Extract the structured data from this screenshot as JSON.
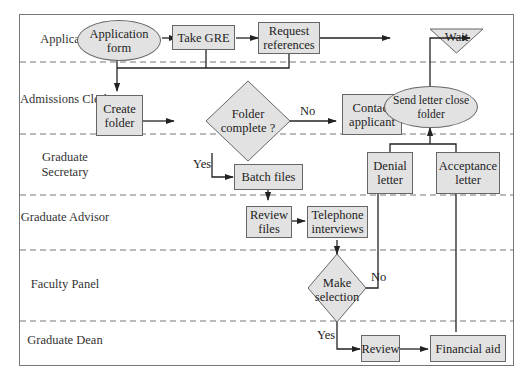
{
  "diagram": {
    "type": "swimlane-flowchart",
    "lanes": [
      {
        "id": "applicant",
        "label": "Applicant"
      },
      {
        "id": "admissions-clerk",
        "label": "Admissions Clerk"
      },
      {
        "id": "graduate-secretary",
        "label": "Graduate Secretary"
      },
      {
        "id": "graduate-advisor",
        "label": "Graduate Advisor"
      },
      {
        "id": "faculty-panel",
        "label": "Faculty Panel"
      },
      {
        "id": "graduate-dean",
        "label": "Graduate Dean"
      }
    ],
    "nodes": {
      "application_form": {
        "label": "Application form",
        "shape": "ellipse",
        "lane": "applicant"
      },
      "take_gre": {
        "label": "Take GRE",
        "shape": "rect",
        "lane": "applicant"
      },
      "request_references": {
        "label": "Request references",
        "shape": "rect",
        "lane": "applicant"
      },
      "wait": {
        "label": "Wait",
        "shape": "triangle-down",
        "lane": "applicant"
      },
      "create_folder": {
        "label": "Create folder",
        "shape": "rect",
        "lane": "admissions-clerk"
      },
      "folder_complete": {
        "label": "Folder complete ?",
        "shape": "diamond",
        "lane": "admissions-clerk"
      },
      "contact_applicant": {
        "label": "Contact applicant",
        "shape": "rect",
        "lane": "admissions-clerk"
      },
      "send_letter": {
        "label": "Send letter close folder",
        "shape": "ellipse",
        "lane": "admissions-clerk"
      },
      "batch_files": {
        "label": "Batch files",
        "shape": "rect",
        "lane": "graduate-secretary"
      },
      "denial_letter": {
        "label": "Denial letter",
        "shape": "rect",
        "lane": "graduate-secretary"
      },
      "acceptance_letter": {
        "label": "Acceptance letter",
        "shape": "rect",
        "lane": "graduate-secretary"
      },
      "review_files": {
        "label": "Review files",
        "shape": "rect",
        "lane": "graduate-advisor"
      },
      "telephone_interviews": {
        "label": "Telephone interviews",
        "shape": "rect",
        "lane": "graduate-advisor"
      },
      "make_selection": {
        "label": "Make selection",
        "shape": "diamond",
        "lane": "faculty-panel"
      },
      "review": {
        "label": "Review",
        "shape": "rect",
        "lane": "graduate-dean"
      },
      "financial_aid": {
        "label": "Financial aid",
        "shape": "rect",
        "lane": "graduate-dean"
      }
    },
    "edges": [
      {
        "from": "application_form",
        "to": "take_gre",
        "label": ""
      },
      {
        "from": "take_gre",
        "to": "request_references",
        "label": ""
      },
      {
        "from": "request_references",
        "to": "wait",
        "label": ""
      },
      {
        "from": "application_form",
        "to": "create_folder",
        "label": ""
      },
      {
        "from": "take_gre",
        "to": "create_folder",
        "label": ""
      },
      {
        "from": "request_references",
        "to": "create_folder",
        "label": ""
      },
      {
        "from": "create_folder",
        "to": "folder_complete",
        "label": ""
      },
      {
        "from": "folder_complete",
        "to": "contact_applicant",
        "label": "No"
      },
      {
        "from": "folder_complete",
        "to": "batch_files",
        "label": "Yes"
      },
      {
        "from": "batch_files",
        "to": "review_files",
        "label": ""
      },
      {
        "from": "review_files",
        "to": "telephone_interviews",
        "label": ""
      },
      {
        "from": "telephone_interviews",
        "to": "make_selection",
        "label": ""
      },
      {
        "from": "make_selection",
        "to": "denial_letter",
        "label": "No"
      },
      {
        "from": "make_selection",
        "to": "review",
        "label": "Yes"
      },
      {
        "from": "review",
        "to": "financial_aid",
        "label": ""
      },
      {
        "from": "financial_aid",
        "to": "acceptance_letter",
        "label": ""
      },
      {
        "from": "denial_letter",
        "to": "send_letter",
        "label": ""
      },
      {
        "from": "acceptance_letter",
        "to": "send_letter",
        "label": ""
      },
      {
        "from": "send_letter",
        "to": "wait",
        "label": ""
      }
    ],
    "edge_labels": {
      "no_contact": "No",
      "yes_batch": "Yes",
      "no_denial": "No",
      "yes_review": "Yes"
    },
    "colors": {
      "node_fill": "#e2e2e2",
      "node_border": "#666666",
      "line": "#222222",
      "lane_divider": "#777777"
    }
  }
}
